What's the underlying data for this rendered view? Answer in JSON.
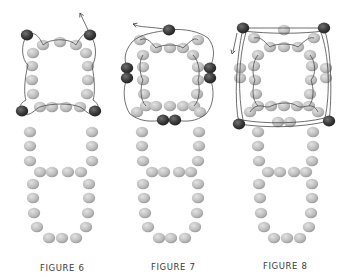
{
  "colors": {
    "background": "#ffffff",
    "grey_bead_light": "#d9d9d9",
    "grey_bead_dark": "#9a9a9a",
    "dark_bead_light": "#6a6a6a",
    "dark_bead_dark": "#262626",
    "thread": "#4a4a4a",
    "caption": "#3a3a3a"
  },
  "figures": [
    {
      "id": "figure-6",
      "label": "FIGURE 6",
      "label_pos": [
        40,
        263
      ],
      "beads": {
        "grey": [
          [
            43,
            45
          ],
          [
            60,
            42
          ],
          [
            76,
            45
          ],
          [
            33,
            53
          ],
          [
            86,
            53
          ],
          [
            32,
            66
          ],
          [
            88,
            66
          ],
          [
            32,
            80
          ],
          [
            88,
            80
          ],
          [
            33,
            94
          ],
          [
            87,
            94
          ],
          [
            40,
            107
          ],
          [
            52,
            107
          ],
          [
            66,
            107
          ],
          [
            80,
            107
          ],
          [
            30,
            132
          ],
          [
            92,
            132
          ],
          [
            30,
            146
          ],
          [
            92,
            146
          ],
          [
            30,
            161
          ],
          [
            92,
            161
          ],
          [
            40,
            172
          ],
          [
            52,
            172
          ],
          [
            68,
            172
          ],
          [
            81,
            172
          ],
          [
            33,
            184
          ],
          [
            89,
            184
          ],
          [
            33,
            198
          ],
          [
            89,
            198
          ],
          [
            34,
            213
          ],
          [
            88,
            213
          ],
          [
            37,
            227
          ],
          [
            86,
            227
          ],
          [
            49,
            238
          ],
          [
            62,
            238
          ],
          [
            76,
            238
          ]
        ],
        "dark": [
          [
            27,
            35
          ],
          [
            90,
            35
          ],
          [
            22,
            111
          ],
          [
            95,
            111
          ]
        ]
      },
      "threads": [
        "M88,30 L80,13",
        "M27,35 C20,45 22,60 28,65 C24,80 24,95 26,100 C18,104 18,112 22,116",
        "M27,35 C35,30 40,38 43,45 C50,38 70,38 76,45 C80,38 85,30 90,35",
        "M90,35 C98,45 96,60 92,66 C95,80 95,95 93,100 C100,104 100,112 95,116",
        "M22,111 C28,120 36,108 40,107 C52,103 70,103 80,107 C86,110 90,118 95,111"
      ],
      "arrows": [
        {
          "tip": [
            80,
            13
          ],
          "from": [
            88,
            30
          ]
        }
      ]
    },
    {
      "id": "figure-7",
      "label": "FIGURE 7",
      "label_pos": [
        151,
        262
      ],
      "beads": {
        "grey": [
          [
            140,
            40
          ],
          [
            198,
            40
          ],
          [
            156,
            48
          ],
          [
            170,
            48
          ],
          [
            183,
            48
          ],
          [
            143,
            55
          ],
          [
            193,
            55
          ],
          [
            143,
            67
          ],
          [
            198,
            67
          ],
          [
            143,
            80
          ],
          [
            198,
            80
          ],
          [
            144,
            94
          ],
          [
            197,
            94
          ],
          [
            146,
            106
          ],
          [
            156,
            106
          ],
          [
            170,
            106
          ],
          [
            183,
            106
          ],
          [
            194,
            106
          ],
          [
            137,
            112
          ],
          [
            200,
            112
          ],
          [
            142,
            132
          ],
          [
            199,
            132
          ],
          [
            142,
            146
          ],
          [
            199,
            146
          ],
          [
            143,
            161
          ],
          [
            198,
            161
          ],
          [
            152,
            172
          ],
          [
            164,
            172
          ],
          [
            179,
            172
          ],
          [
            191,
            172
          ],
          [
            143,
            184
          ],
          [
            198,
            184
          ],
          [
            144,
            198
          ],
          [
            198,
            198
          ],
          [
            145,
            213
          ],
          [
            197,
            213
          ],
          [
            148,
            227
          ],
          [
            195,
            227
          ],
          [
            159,
            238
          ],
          [
            171,
            238
          ],
          [
            185,
            238
          ]
        ],
        "dark": [
          [
            169,
            30
          ],
          [
            127,
            68
          ],
          [
            127,
            78
          ],
          [
            210,
            68
          ],
          [
            210,
            78
          ],
          [
            163,
            120
          ],
          [
            175,
            120
          ]
        ]
      },
      "threads": [
        "M169,30 C150,26 140,28 133,24",
        "M169,30 C185,28 200,32 208,38 C216,48 214,58 210,68",
        "M169,30 C155,32 140,34 132,42 C124,52 124,60 127,68",
        "M127,78 C122,90 124,105 130,114 C140,122 152,122 163,120",
        "M210,78 C215,90 214,105 206,114 C196,122 186,122 175,120",
        "M140,40 C148,36 152,44 156,48 C162,44 178,44 183,48 C188,44 194,36 198,40",
        "M143,55 C138,62 140,75 143,80 C140,88 140,100 146,106",
        "M193,55 C200,62 200,75 198,80 C200,88 200,100 194,106"
      ],
      "arrows": [
        {
          "tip": [
            133,
            24
          ],
          "from": [
            142,
            27
          ]
        }
      ]
    },
    {
      "id": "figure-8",
      "label": "FIGURE 8",
      "label_pos": [
        263,
        261
      ],
      "beads": {
        "grey": [
          [
            284,
            30
          ],
          [
            254,
            38
          ],
          [
            314,
            38
          ],
          [
            270,
            47
          ],
          [
            284,
            47
          ],
          [
            298,
            47
          ],
          [
            258,
            55
          ],
          [
            310,
            55
          ],
          [
            240,
            68
          ],
          [
            326,
            68
          ],
          [
            240,
            78
          ],
          [
            326,
            78
          ],
          [
            254,
            66
          ],
          [
            312,
            66
          ],
          [
            255,
            80
          ],
          [
            311,
            80
          ],
          [
            256,
            94
          ],
          [
            310,
            94
          ],
          [
            258,
            106
          ],
          [
            271,
            106
          ],
          [
            284,
            106
          ],
          [
            297,
            106
          ],
          [
            309,
            106
          ],
          [
            250,
            112
          ],
          [
            318,
            112
          ],
          [
            278,
            122
          ],
          [
            290,
            122
          ],
          [
            258,
            132
          ],
          [
            313,
            132
          ],
          [
            258,
            146
          ],
          [
            313,
            146
          ],
          [
            259,
            161
          ],
          [
            312,
            161
          ],
          [
            268,
            172
          ],
          [
            280,
            172
          ],
          [
            294,
            172
          ],
          [
            306,
            172
          ],
          [
            259,
            184
          ],
          [
            312,
            184
          ],
          [
            260,
            198
          ],
          [
            312,
            198
          ],
          [
            261,
            213
          ],
          [
            311,
            213
          ],
          [
            264,
            227
          ],
          [
            309,
            227
          ],
          [
            274,
            238
          ],
          [
            287,
            238
          ],
          [
            300,
            238
          ]
        ],
        "dark": [
          [
            243,
            28
          ],
          [
            324,
            28
          ],
          [
            239,
            124
          ],
          [
            329,
            121
          ]
        ]
      },
      "threads": [
        "M243,28 L324,28",
        "M243,31 C270,34 300,34 324,31",
        "M324,28 C332,50 332,100 329,121",
        "M320,30 C330,55 330,95 325,118",
        "M243,28 C236,60 234,100 239,124",
        "M246,32 C238,60 238,95 243,120",
        "M239,124 C265,128 300,128 329,121",
        "M242,120 C265,124 300,124 325,118",
        "M237,33 L233,52",
        "M254,38 C262,36 266,44 270,47 C276,43 292,43 298,47 C302,44 308,36 314,38",
        "M258,55 C252,62 252,75 255,80 C252,88 252,100 258,106",
        "M310,55 C316,62 316,75 311,80 C314,88 314,100 309,106",
        "M250,112 C258,100 266,110 271,106 C280,102 292,102 297,106 C304,110 312,100 318,112"
      ],
      "arrows": [
        {
          "tip": [
            232,
            54
          ],
          "from": [
            236,
            40
          ]
        }
      ]
    }
  ]
}
